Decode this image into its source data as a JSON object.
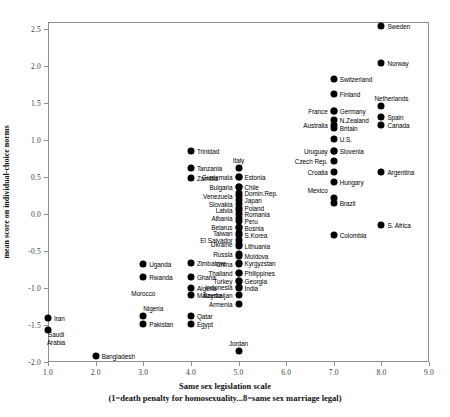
{
  "chart_data": {
    "type": "scatter",
    "title": "",
    "xlabel": "Same sex legislation scale",
    "xlabel_sub": "(1=death penalty for homosexuality...8=same sex marriage legal)",
    "ylabel": "mean score on individual-choice norms",
    "xlim": [
      1.0,
      9.0
    ],
    "ylim": [
      -2.0,
      2.6
    ],
    "xticks": [
      "1.0",
      "2.0",
      "3.0",
      "4.0",
      "5.0",
      "6.0",
      "7.0",
      "8.0",
      "9.0"
    ],
    "xtick_values": [
      1.0,
      2.0,
      3.0,
      4.0,
      5.0,
      6.0,
      7.0,
      8.0,
      9.0
    ],
    "yticks": [
      "2.5",
      "2.0",
      "1.5",
      "1.0",
      "0.5",
      "0.0",
      "-0.5",
      "-1.0",
      "-1.5",
      "-2.0"
    ],
    "ytick_values": [
      2.5,
      2.0,
      1.5,
      1.0,
      0.5,
      0.0,
      -0.5,
      -1.0,
      -1.5,
      -2.0
    ],
    "grid": false,
    "legend": "none",
    "marker_color": "#000000",
    "points": [
      {
        "label": "Sweden",
        "x": 8.0,
        "y": 2.55,
        "pos": "r"
      },
      {
        "label": "Norway",
        "x": 8.0,
        "y": 2.05,
        "pos": "r"
      },
      {
        "label": "Switzerland",
        "x": 7.0,
        "y": 1.83,
        "pos": "r"
      },
      {
        "label": "Finland",
        "x": 7.0,
        "y": 1.63,
        "pos": "r"
      },
      {
        "label": "Netherlands",
        "x": 8.0,
        "y": 1.46,
        "pos": "above-r"
      },
      {
        "label": "Germany",
        "x": 7.0,
        "y": 1.4,
        "pos": "r"
      },
      {
        "label": "France",
        "x": 7.0,
        "y": 1.4,
        "pos": "l"
      },
      {
        "label": "Spain",
        "x": 8.0,
        "y": 1.31,
        "pos": "r"
      },
      {
        "label": "N.Zealand",
        "x": 7.0,
        "y": 1.28,
        "pos": "r"
      },
      {
        "label": "Canada",
        "x": 8.0,
        "y": 1.2,
        "pos": "r"
      },
      {
        "label": "Britain",
        "x": 7.0,
        "y": 1.17,
        "pos": "r"
      },
      {
        "label": "Australia",
        "x": 7.0,
        "y": 1.21,
        "pos": "l"
      },
      {
        "label": "U.S.",
        "x": 7.0,
        "y": 1.02,
        "pos": "r"
      },
      {
        "label": "Slovenia",
        "x": 7.0,
        "y": 0.86,
        "pos": "r"
      },
      {
        "label": "Uruguay",
        "x": 7.0,
        "y": 0.86,
        "pos": "l"
      },
      {
        "label": "Czech Rep.",
        "x": 7.0,
        "y": 0.72,
        "pos": "l"
      },
      {
        "label": "Argentina",
        "x": 8.0,
        "y": 0.57,
        "pos": "r"
      },
      {
        "label": "Croatia",
        "x": 7.0,
        "y": 0.57,
        "pos": "l"
      },
      {
        "label": "Hungary",
        "x": 7.0,
        "y": 0.44,
        "pos": "r"
      },
      {
        "label": "Mexico",
        "x": 7.0,
        "y": 0.22,
        "pos": "l-above"
      },
      {
        "label": "Brazil",
        "x": 7.0,
        "y": 0.15,
        "pos": "r"
      },
      {
        "label": "S. Africa",
        "x": 8.0,
        "y": -0.14,
        "pos": "r"
      },
      {
        "label": "Colombia",
        "x": 7.0,
        "y": -0.28,
        "pos": "r"
      },
      {
        "label": "Italy",
        "x": 5.0,
        "y": 0.62,
        "pos": "above"
      },
      {
        "label": "Estonia",
        "x": 5.0,
        "y": 0.5,
        "pos": "r"
      },
      {
        "label": "Guatemala",
        "x": 5.0,
        "y": 0.5,
        "pos": "l"
      },
      {
        "label": "Chile",
        "x": 5.0,
        "y": 0.37,
        "pos": "r"
      },
      {
        "label": "Bulgaria",
        "x": 5.0,
        "y": 0.37,
        "pos": "l"
      },
      {
        "label": "Domin.Rep.",
        "x": 5.0,
        "y": 0.28,
        "pos": "r"
      },
      {
        "label": "Venezuela",
        "x": 5.0,
        "y": 0.25,
        "pos": "l"
      },
      {
        "label": "Japan",
        "x": 5.0,
        "y": 0.19,
        "pos": "r"
      },
      {
        "label": "Slovakia",
        "x": 5.0,
        "y": 0.14,
        "pos": "l"
      },
      {
        "label": "Poland",
        "x": 5.0,
        "y": 0.09,
        "pos": "r"
      },
      {
        "label": "Latvia",
        "x": 5.0,
        "y": 0.06,
        "pos": "l"
      },
      {
        "label": "Romania",
        "x": 5.0,
        "y": 0.0,
        "pos": "r"
      },
      {
        "label": "Albania",
        "x": 5.0,
        "y": -0.05,
        "pos": "l"
      },
      {
        "label": "Peru",
        "x": 5.0,
        "y": -0.09,
        "pos": "r"
      },
      {
        "label": "Belarus",
        "x": 5.0,
        "y": -0.17,
        "pos": "l"
      },
      {
        "label": "Bosnia",
        "x": 5.0,
        "y": -0.19,
        "pos": "r"
      },
      {
        "label": "Taiwan",
        "x": 5.0,
        "y": -0.25,
        "pos": "l"
      },
      {
        "label": "S.Korea",
        "x": 5.0,
        "y": -0.28,
        "pos": "r"
      },
      {
        "label": "El Salvador",
        "x": 5.0,
        "y": -0.35,
        "pos": "l"
      },
      {
        "label": "Lithuania",
        "x": 5.0,
        "y": -0.43,
        "pos": "r"
      },
      {
        "label": "Ukraine",
        "x": 5.0,
        "y": -0.41,
        "pos": "l"
      },
      {
        "label": "Russia",
        "x": 5.0,
        "y": -0.54,
        "pos": "l"
      },
      {
        "label": "Moldova",
        "x": 5.0,
        "y": -0.56,
        "pos": "r"
      },
      {
        "label": "China",
        "x": 5.0,
        "y": -0.67,
        "pos": "l"
      },
      {
        "label": "Kyrgyzstan",
        "x": 5.0,
        "y": -0.66,
        "pos": "r"
      },
      {
        "label": "Thailand",
        "x": 5.0,
        "y": -0.79,
        "pos": "l"
      },
      {
        "label": "Philippines",
        "x": 5.0,
        "y": -0.8,
        "pos": "r"
      },
      {
        "label": "Turkey",
        "x": 5.0,
        "y": -0.9,
        "pos": "l"
      },
      {
        "label": "Georgia",
        "x": 5.0,
        "y": -0.9,
        "pos": "r"
      },
      {
        "label": "Indonesia",
        "x": 5.0,
        "y": -0.99,
        "pos": "l"
      },
      {
        "label": "India",
        "x": 5.0,
        "y": -1.0,
        "pos": "r"
      },
      {
        "label": "Azerbaijan",
        "x": 5.0,
        "y": -1.1,
        "pos": "l"
      },
      {
        "label": "Armenia",
        "x": 5.0,
        "y": -1.22,
        "pos": "l"
      },
      {
        "label": "Jordan",
        "x": 5.0,
        "y": -1.85,
        "pos": "above"
      },
      {
        "label": "Trinidad",
        "x": 4.0,
        "y": 0.85,
        "pos": "r"
      },
      {
        "label": "Tanzania",
        "x": 4.0,
        "y": 0.62,
        "pos": "r"
      },
      {
        "label": "Zambia",
        "x": 4.0,
        "y": 0.49,
        "pos": "r"
      },
      {
        "label": "Zimbabwe",
        "x": 4.0,
        "y": -0.66,
        "pos": "r"
      },
      {
        "label": "Ghana",
        "x": 4.0,
        "y": -0.85,
        "pos": "r"
      },
      {
        "label": "Algeria",
        "x": 4.0,
        "y": -1.0,
        "pos": "r"
      },
      {
        "label": "Malaysia",
        "x": 4.0,
        "y": -1.1,
        "pos": "r"
      },
      {
        "label": "Qatar",
        "x": 4.0,
        "y": -1.38,
        "pos": "r"
      },
      {
        "label": "Egypt",
        "x": 4.0,
        "y": -1.48,
        "pos": "r"
      },
      {
        "label": "Uganda",
        "x": 3.0,
        "y": -0.68,
        "pos": "r"
      },
      {
        "label": "Rwanda",
        "x": 3.0,
        "y": -0.85,
        "pos": "r"
      },
      {
        "label": "Morocco",
        "x": 3.0,
        "y": -1.06,
        "pos": "r-noDot"
      },
      {
        "label": "Nigeria",
        "x": 3.0,
        "y": -1.38,
        "pos": "above-r"
      },
      {
        "label": "Pakistan",
        "x": 3.0,
        "y": -1.48,
        "pos": "r"
      },
      {
        "label": "Bangladesh",
        "x": 2.0,
        "y": -1.92,
        "pos": "r"
      },
      {
        "label": "Iran",
        "x": 1.0,
        "y": -1.4,
        "pos": "r"
      },
      {
        "label": "Saudi Arabia",
        "x": 1.0,
        "y": -1.57,
        "pos": "below-r"
      }
    ]
  }
}
